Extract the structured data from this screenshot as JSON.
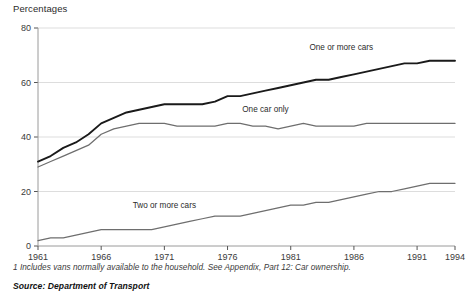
{
  "chart": {
    "title": "Percentages",
    "footnote": "1 Includes vans normally available to the household. See Appendix, Part 12: Car ownership.",
    "source": "Source: Department of Transport"
  },
  "chart_data": {
    "type": "line",
    "title": "Percentages",
    "xlabel": "",
    "ylabel": "Percentages",
    "xlim": [
      1961,
      1994
    ],
    "ylim": [
      0,
      80
    ],
    "yticks": [
      0,
      20,
      40,
      60,
      80
    ],
    "xticks": [
      1961,
      1966,
      1971,
      1976,
      1981,
      1986,
      1991,
      1994
    ],
    "grid": "horizontal",
    "legend_position": "inline-labels",
    "x": [
      1961,
      1962,
      1963,
      1964,
      1965,
      1966,
      1967,
      1968,
      1969,
      1970,
      1971,
      1972,
      1973,
      1974,
      1975,
      1976,
      1977,
      1978,
      1979,
      1980,
      1981,
      1982,
      1983,
      1984,
      1985,
      1986,
      1987,
      1988,
      1989,
      1990,
      1991,
      1992,
      1993,
      1994
    ],
    "series": [
      {
        "name": "One or more cars",
        "color": "#1a1a1a",
        "label_x": 1985,
        "label_y": 72,
        "values": [
          31,
          33,
          36,
          38,
          41,
          45,
          47,
          49,
          50,
          51,
          52,
          52,
          52,
          52,
          53,
          55,
          55,
          56,
          57,
          58,
          59,
          60,
          61,
          61,
          62,
          63,
          64,
          65,
          66,
          67,
          67,
          68,
          68,
          68
        ]
      },
      {
        "name": "One car only",
        "color": "#6e6e6e",
        "label_x": 1979,
        "label_y": 49,
        "values": [
          29,
          31,
          33,
          35,
          37,
          41,
          43,
          44,
          45,
          45,
          45,
          44,
          44,
          44,
          44,
          45,
          45,
          44,
          44,
          43,
          44,
          45,
          44,
          44,
          44,
          44,
          45,
          45,
          45,
          45,
          45,
          45,
          45,
          45
        ]
      },
      {
        "name": "Two or more cars",
        "color": "#6e6e6e",
        "label_x": 1971,
        "label_y": 14,
        "values": [
          2,
          3,
          3,
          4,
          5,
          6,
          6,
          6,
          6,
          6,
          7,
          8,
          9,
          10,
          11,
          11,
          11,
          12,
          13,
          14,
          15,
          15,
          16,
          16,
          17,
          18,
          19,
          20,
          20,
          21,
          22,
          23,
          23,
          23
        ]
      }
    ]
  }
}
